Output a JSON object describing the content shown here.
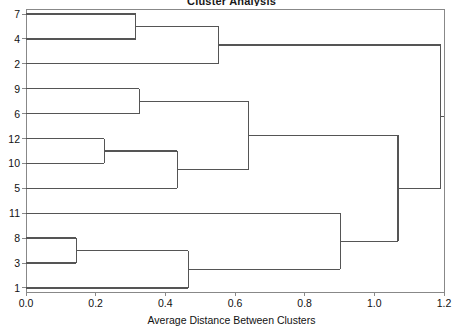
{
  "chart_data": {
    "type": "dendrogram",
    "title": "Cluster Analysis",
    "xlabel": "Average Distance Between Clusters",
    "ylabel": "",
    "xlim": [
      0.0,
      1.2
    ],
    "xticks": [
      "0.0",
      "0.2",
      "0.4",
      "0.6",
      "0.8",
      "1.0",
      "1.2"
    ],
    "xtick_values": [
      0.0,
      0.2,
      0.4,
      0.6,
      0.8,
      1.0,
      1.2
    ],
    "grid": false,
    "legend": "none",
    "orientation": "horizontal",
    "leaf_order": [
      "7",
      "4",
      "2",
      "9",
      "6",
      "12",
      "10",
      "5",
      "11",
      "8",
      "3",
      "1"
    ],
    "line_color": "#555555",
    "axis_color": "#888888",
    "merges": [
      {
        "id": "m1",
        "label": "7+4",
        "left": "7",
        "right": "4",
        "height": 0.315
      },
      {
        "id": "m2",
        "label": "(7,4)+2",
        "left": "m1",
        "right": "2",
        "height": 0.552
      },
      {
        "id": "m3",
        "label": "9+6",
        "left": "9",
        "right": "6",
        "height": 0.325
      },
      {
        "id": "m4",
        "label": "12+10",
        "left": "12",
        "right": "10",
        "height": 0.225
      },
      {
        "id": "m5",
        "label": "(12,10)+5",
        "left": "m4",
        "right": "5",
        "height": 0.434
      },
      {
        "id": "m6",
        "label": "(9,6)+(12,10,5)",
        "left": "m3",
        "right": "m5",
        "height": 0.638
      },
      {
        "id": "m7",
        "label": "8+3",
        "left": "8",
        "right": "3",
        "height": 0.144
      },
      {
        "id": "m8",
        "label": "(8,3)+1",
        "left": "m7",
        "right": "1",
        "height": 0.466
      },
      {
        "id": "m9",
        "label": "11+(8,3,1)",
        "left": "11",
        "right": "m8",
        "height": 0.902
      },
      {
        "id": "m10",
        "label": "mid+bottom",
        "left": "m6",
        "right": "m9",
        "height": 1.068
      },
      {
        "id": "m11",
        "label": "root",
        "left": "m2",
        "right": "m10",
        "height": 1.19
      }
    ]
  }
}
